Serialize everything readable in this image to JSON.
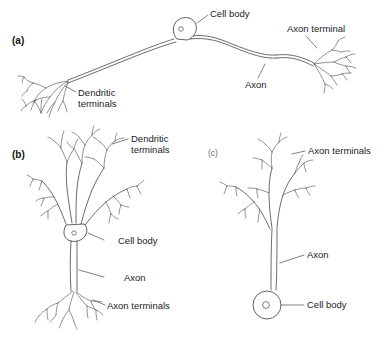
{
  "figure": {
    "background_color": "#ffffff",
    "ink_color": "#3a3a3a",
    "label_color": "#1b1b1b",
    "title": "",
    "panels": [
      {
        "id": "a",
        "panel_label": "(a)",
        "neuron_type": "multipolar-long-axon-neuron",
        "orientation": "horizontal",
        "labels": [
          {
            "key": "cell_body",
            "text": "Cell body",
            "lines": [
              "Cell body"
            ]
          },
          {
            "key": "axon_terminal",
            "text": "Axon terminal",
            "lines": [
              "Axon terminal"
            ]
          },
          {
            "key": "axon",
            "text": "Axon",
            "lines": [
              "Axon"
            ]
          },
          {
            "key": "dendritic_terminals",
            "text": "Dendritic terminals",
            "lines": [
              "Dendritic",
              "terminals"
            ]
          }
        ]
      },
      {
        "id": "b",
        "panel_label": "(b)",
        "neuron_type": "pyramidal-neuron",
        "orientation": "vertical",
        "labels": [
          {
            "key": "dendritic_terminals",
            "text": "Dendritic terminals",
            "lines": [
              "Dendritic",
              "terminals"
            ]
          },
          {
            "key": "cell_body",
            "text": "Cell body",
            "lines": [
              "Cell body"
            ]
          },
          {
            "key": "axon",
            "text": "Axon",
            "lines": [
              "Axon"
            ]
          },
          {
            "key": "axon_terminals",
            "text": "Axon terminals",
            "lines": [
              "Axon terminals"
            ]
          }
        ]
      },
      {
        "id": "c",
        "panel_label": "(c)",
        "neuron_type": "unipolar-sensory-neuron",
        "orientation": "vertical",
        "labels": [
          {
            "key": "axon_terminals",
            "text": "Axon terminals",
            "lines": [
              "Axon terminals"
            ]
          },
          {
            "key": "axon",
            "text": "Axon",
            "lines": [
              "Axon"
            ]
          },
          {
            "key": "cell_body",
            "text": "Cell body",
            "lines": [
              "Cell body"
            ]
          }
        ]
      }
    ]
  }
}
